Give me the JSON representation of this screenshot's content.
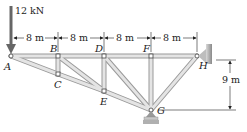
{
  "diagram": {
    "type": "truss",
    "load": {
      "label": "12 kN",
      "at_joint": "A",
      "direction": "down"
    },
    "joints": [
      {
        "id": "A",
        "label": "A"
      },
      {
        "id": "B",
        "label": "B"
      },
      {
        "id": "C",
        "label": "C"
      },
      {
        "id": "D",
        "label": "D"
      },
      {
        "id": "E",
        "label": "E"
      },
      {
        "id": "F",
        "label": "F"
      },
      {
        "id": "G",
        "label": "G"
      },
      {
        "id": "H",
        "label": "H"
      }
    ],
    "members": [
      [
        "A",
        "B"
      ],
      [
        "B",
        "D"
      ],
      [
        "D",
        "F"
      ],
      [
        "F",
        "H"
      ],
      [
        "A",
        "C"
      ],
      [
        "C",
        "E"
      ],
      [
        "E",
        "G"
      ],
      [
        "G",
        "H"
      ],
      [
        "B",
        "C"
      ],
      [
        "D",
        "E"
      ],
      [
        "F",
        "G"
      ],
      [
        "B",
        "E"
      ],
      [
        "D",
        "G"
      ]
    ],
    "dimensions": {
      "spans": [
        "8 m",
        "8 m",
        "8 m",
        "8 m"
      ],
      "height": "9 m"
    },
    "supports": {
      "H": "pin-wall",
      "G": "roller"
    }
  }
}
